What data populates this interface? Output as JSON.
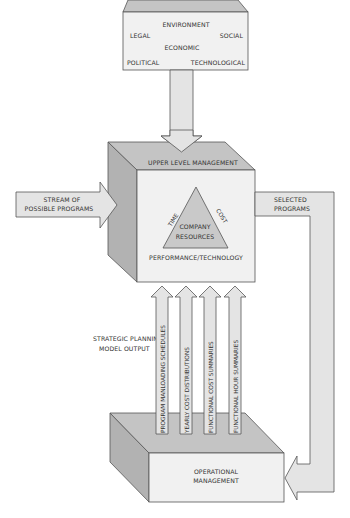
{
  "environment": {
    "title": "ENVIRONMENT",
    "factors": {
      "legal": "LEGAL",
      "social": "SOCIAL",
      "economic": "ECONOMIC",
      "political": "POLITICAL",
      "technological": "TECHNOLOGICAL"
    }
  },
  "upper_management": {
    "title": "UPPER LEVEL MANAGEMENT",
    "triangle": {
      "left_side": "TIME",
      "right_side": "COST",
      "base": "PERFORMANCE/TECHNOLOGY",
      "center_line1": "COMPANY",
      "center_line2": "RESOURCES"
    }
  },
  "input_arrow": {
    "line1": "STREAM OF",
    "line2": "POSSIBLE PROGRAMS"
  },
  "output_arrow": {
    "line1": "SELECTED",
    "line2": "PROGRAMS"
  },
  "strategic_output": {
    "line1": "STRATEGIC PLANNING",
    "line2": "MODEL OUTPUT",
    "reports": [
      "PROGRAM MANLOADING SCHEDULES",
      "YEARLY COST DISTRIBUTIONS",
      "FUNCTIONAL COST SUMMARIES",
      "FUNCTIONAL HOUR SUMMARIES"
    ]
  },
  "operational_management": {
    "line1": "OPERATIONAL",
    "line2": "MANAGEMENT"
  },
  "colors": {
    "front_face": "#f1f1f1",
    "top_face": "#c4c4c4",
    "side_face": "#b2b2b2",
    "arrow": "#e4e4e4",
    "outline": "#555555",
    "text": "#333333"
  }
}
